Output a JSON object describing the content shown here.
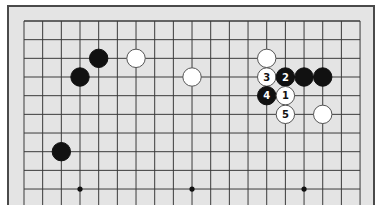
{
  "diagram": {
    "type": "go-board-partial",
    "board_size": 19,
    "visible_rows": 10,
    "edge": "top",
    "colors": {
      "frame_bg": "#e4e4e4",
      "frame_border": "#4a4a4a",
      "grid_line": "#3a3a3a",
      "black_stone": "#111111",
      "white_stone": "#ffffff",
      "white_outline": "#555555"
    },
    "star_points": [
      {
        "col": 3,
        "row": 9
      },
      {
        "col": 9,
        "row": 9
      },
      {
        "col": 15,
        "row": 9
      }
    ],
    "stones": [
      {
        "color": "black",
        "col": 4,
        "row": 2,
        "label": ""
      },
      {
        "color": "black",
        "col": 3,
        "row": 3,
        "label": ""
      },
      {
        "color": "black",
        "col": 2,
        "row": 7,
        "label": ""
      },
      {
        "color": "white",
        "col": 6,
        "row": 2,
        "label": ""
      },
      {
        "color": "white",
        "col": 9,
        "row": 3,
        "label": ""
      },
      {
        "color": "white",
        "col": 13,
        "row": 2,
        "label": ""
      },
      {
        "color": "white",
        "col": 13,
        "row": 3,
        "label": "3"
      },
      {
        "color": "black",
        "col": 14,
        "row": 3,
        "label": "2"
      },
      {
        "color": "black",
        "col": 15,
        "row": 3,
        "label": ""
      },
      {
        "color": "black",
        "col": 16,
        "row": 3,
        "label": ""
      },
      {
        "color": "black",
        "col": 13,
        "row": 4,
        "label": "4"
      },
      {
        "color": "white",
        "col": 14,
        "row": 4,
        "label": "1"
      },
      {
        "color": "white",
        "col": 14,
        "row": 5,
        "label": "5"
      },
      {
        "color": "white",
        "col": 16,
        "row": 5,
        "label": ""
      }
    ]
  }
}
